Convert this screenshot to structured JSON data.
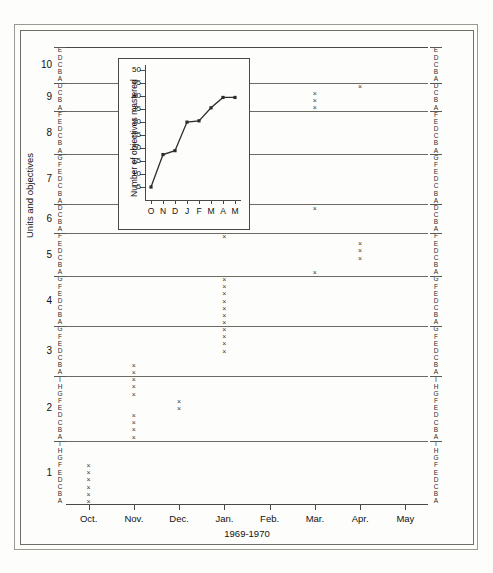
{
  "figure": {
    "y_axis_caption": "Units and objectives",
    "x_axis_caption": "1969-1970",
    "x_labels": [
      "Oct.",
      "Nov.",
      "Dec.",
      "Jan.",
      "Feb.",
      "Mar.",
      "Apr.",
      "May"
    ],
    "unit_numbers": [
      "1",
      "2",
      "3",
      "4",
      "5",
      "6",
      "7",
      "8",
      "9",
      "10"
    ]
  },
  "chart_data": {
    "type": "scatter",
    "title": "",
    "xlabel": "1969-1970",
    "ylabel": "Units and objectives",
    "grid": true,
    "legend": "none",
    "x_categories": [
      "Oct.",
      "Nov.",
      "Dec.",
      "Jan.",
      "Feb.",
      "Mar.",
      "Apr.",
      "May"
    ],
    "marker": "x",
    "units": [
      {
        "unit": "1",
        "objectives": [
          "A",
          "B",
          "C",
          "D",
          "E",
          "F",
          "G",
          "H",
          "I"
        ]
      },
      {
        "unit": "2",
        "objectives": [
          "A",
          "B",
          "C",
          "D",
          "E",
          "F",
          "G",
          "H",
          "I"
        ]
      },
      {
        "unit": "3",
        "objectives": [
          "A",
          "B",
          "C",
          "D",
          "E",
          "F",
          "G"
        ]
      },
      {
        "unit": "4",
        "objectives": [
          "A",
          "B",
          "C",
          "D",
          "E",
          "F",
          "G"
        ]
      },
      {
        "unit": "5",
        "objectives": [
          "A",
          "B",
          "C",
          "D",
          "E",
          "F"
        ]
      },
      {
        "unit": "6",
        "objectives": [
          "A",
          "B",
          "C",
          "D"
        ]
      },
      {
        "unit": "7",
        "objectives": [
          "A",
          "B",
          "C",
          "D",
          "E",
          "F",
          "G"
        ]
      },
      {
        "unit": "8",
        "objectives": [
          "A",
          "B",
          "C",
          "D",
          "E",
          "F"
        ]
      },
      {
        "unit": "9",
        "objectives": [
          "A",
          "B",
          "C",
          "D"
        ]
      },
      {
        "unit": "10",
        "objectives": [
          "A",
          "B",
          "C",
          "D",
          "E"
        ]
      }
    ],
    "points": [
      {
        "unit": "1",
        "objective": "A",
        "month": "Oct."
      },
      {
        "unit": "1",
        "objective": "B",
        "month": "Oct."
      },
      {
        "unit": "1",
        "objective": "C",
        "month": "Oct."
      },
      {
        "unit": "1",
        "objective": "D",
        "month": "Oct."
      },
      {
        "unit": "1",
        "objective": "E",
        "month": "Oct."
      },
      {
        "unit": "1",
        "objective": "F",
        "month": "Oct."
      },
      {
        "unit": "2",
        "objective": "A",
        "month": "Nov."
      },
      {
        "unit": "2",
        "objective": "B",
        "month": "Nov."
      },
      {
        "unit": "2",
        "objective": "C",
        "month": "Nov."
      },
      {
        "unit": "2",
        "objective": "D",
        "month": "Nov."
      },
      {
        "unit": "2",
        "objective": "E",
        "month": "Dec."
      },
      {
        "unit": "2",
        "objective": "F",
        "month": "Dec."
      },
      {
        "unit": "2",
        "objective": "G",
        "month": "Nov."
      },
      {
        "unit": "2",
        "objective": "H",
        "month": "Nov."
      },
      {
        "unit": "2",
        "objective": "I",
        "month": "Nov."
      },
      {
        "unit": "3",
        "objective": "A",
        "month": "Nov."
      },
      {
        "unit": "3",
        "objective": "B",
        "month": "Nov."
      },
      {
        "unit": "3",
        "objective": "D",
        "month": "Jan."
      },
      {
        "unit": "3",
        "objective": "E",
        "month": "Jan."
      },
      {
        "unit": "3",
        "objective": "F",
        "month": "Jan."
      },
      {
        "unit": "3",
        "objective": "G",
        "month": "Jan."
      },
      {
        "unit": "4",
        "objective": "A",
        "month": "Jan."
      },
      {
        "unit": "4",
        "objective": "B",
        "month": "Jan."
      },
      {
        "unit": "4",
        "objective": "C",
        "month": "Jan."
      },
      {
        "unit": "4",
        "objective": "D",
        "month": "Jan."
      },
      {
        "unit": "4",
        "objective": "E",
        "month": "Jan."
      },
      {
        "unit": "4",
        "objective": "F",
        "month": "Jan."
      },
      {
        "unit": "4",
        "objective": "G",
        "month": "Jan."
      },
      {
        "unit": "5",
        "objective": "A",
        "month": "Mar."
      },
      {
        "unit": "5",
        "objective": "C",
        "month": "Apr."
      },
      {
        "unit": "5",
        "objective": "D",
        "month": "Apr."
      },
      {
        "unit": "5",
        "objective": "E",
        "month": "Apr."
      },
      {
        "unit": "5",
        "objective": "F",
        "month": "Jan."
      },
      {
        "unit": "6",
        "objective": "D",
        "month": "Mar."
      },
      {
        "unit": "9",
        "objective": "A",
        "month": "Mar."
      },
      {
        "unit": "9",
        "objective": "B",
        "month": "Mar."
      },
      {
        "unit": "9",
        "objective": "C",
        "month": "Mar."
      },
      {
        "unit": "9",
        "objective": "D",
        "month": "Apr."
      }
    ]
  },
  "inset": {
    "chart_data": {
      "type": "line",
      "title": "",
      "xlabel": "",
      "ylabel": "Number of objectives mastered",
      "categories": [
        "O",
        "N",
        "D",
        "J",
        "F",
        "M",
        "A",
        "M"
      ],
      "values": [
        5,
        17.5,
        19,
        30,
        30.5,
        35.5,
        39.5,
        39.5
      ],
      "ylim": [
        0,
        52
      ],
      "yticks": [
        5,
        10,
        15,
        20,
        25,
        30,
        35,
        40,
        45,
        50
      ],
      "grid": false,
      "legend": "none",
      "marker": "square"
    }
  }
}
